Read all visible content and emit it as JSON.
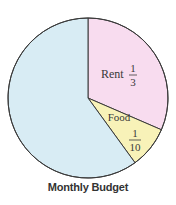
{
  "chart_data": {
    "type": "pie",
    "title": "Monthly Budget",
    "slices": [
      {
        "label": "Rent",
        "fraction_text": {
          "num": "1",
          "den": "3"
        },
        "value": 0.3333,
        "color": "#f8dcef"
      },
      {
        "label": "Food",
        "fraction_text": {
          "num": "1",
          "den": "10"
        },
        "value": 0.1,
        "color": "#f8f2b8"
      },
      {
        "label": "",
        "value": 0.5667,
        "color": "#d8ecf4"
      }
    ],
    "start_angle_deg": 0,
    "direction": "clockwise",
    "legend": "none"
  }
}
